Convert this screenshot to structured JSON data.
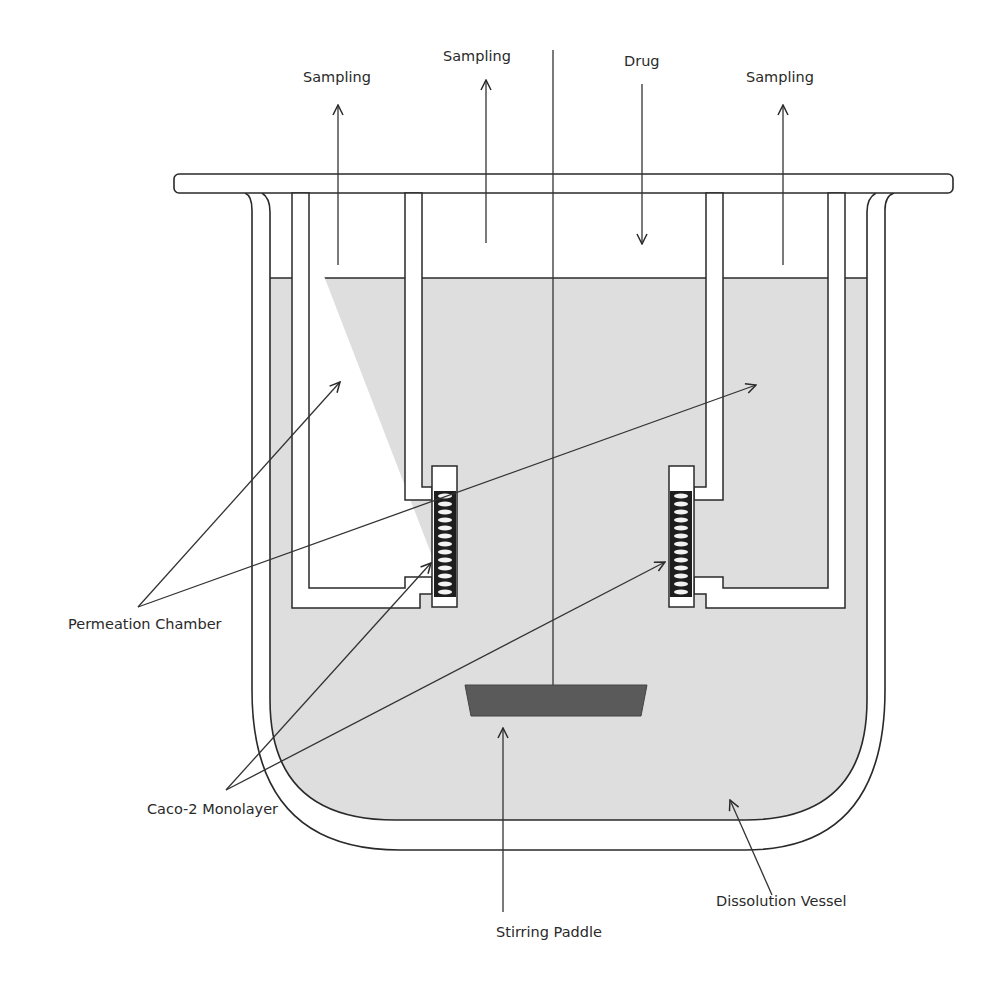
{
  "figure": {
    "colors": {
      "medium_fill": "#dedede",
      "line": "#2a2a2a",
      "paddle": "#5a5a5a",
      "background": "#ffffff"
    }
  },
  "labels": {
    "sampling_left": "Sampling",
    "sampling_center": "Sampling",
    "drug": "Drug",
    "sampling_right": "Sampling",
    "permeation_chamber": "Permeation Chamber",
    "caco2_monolayer": "Caco-2 Monolayer",
    "stirring_paddle": "Stirring Paddle",
    "dissolution_vessel": "Dissolution Vessel"
  },
  "icons": {
    "arrow_up": "arrow-up",
    "arrow_down": "arrow-down",
    "monolayer_coil": "coil"
  }
}
